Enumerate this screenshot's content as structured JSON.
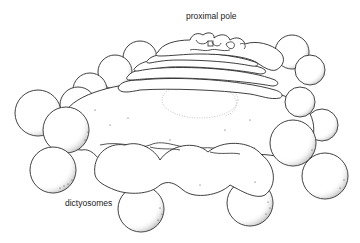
{
  "diagram": {
    "labels": {
      "top": "proximal pole",
      "bottom": "dictyosomes"
    },
    "colors": {
      "line": "#2a2a2a",
      "background": "#ffffff",
      "stipple": "#444444"
    }
  }
}
